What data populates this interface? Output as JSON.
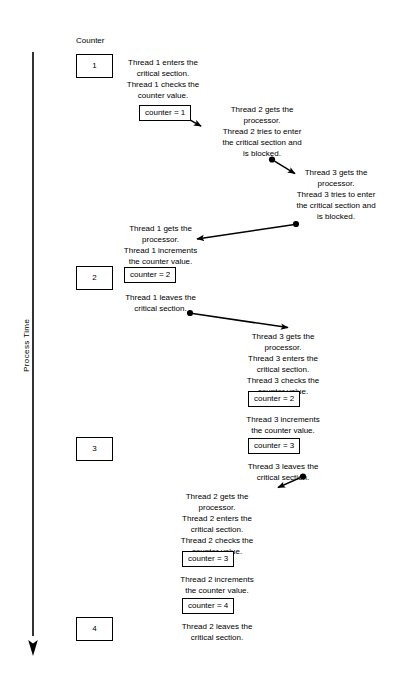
{
  "diagram": {
    "title_axis": "Process Time",
    "column_header": "Counter",
    "counter_values": [
      {
        "value": "1"
      },
      {
        "value": "2"
      },
      {
        "value": "3"
      },
      {
        "value": "4"
      }
    ],
    "value_boxes": [
      {
        "label": "counter = 1"
      },
      {
        "label": "counter = 2"
      },
      {
        "label": "counter = 2"
      },
      {
        "label": "counter = 3"
      },
      {
        "label": "counter = 3"
      },
      {
        "label": "counter = 4"
      }
    ],
    "events": [
      {
        "text": "Thread 1 enters the\ncritical section.\nThread 1 checks the\ncounter value."
      },
      {
        "text": "Thread 2 gets the\nprocessor.\nThread 2 tries to enter\nthe critical section and\nis blocked."
      },
      {
        "text": "Thread 3 gets the\nprocessor.\nThread 3 tries to enter\nthe critical section and\nis blocked."
      },
      {
        "text": "Thread 1 gets the\nprocessor.\nThread 1 increments\nthe counter value."
      },
      {
        "text": "Thread 1 leaves the\ncritical section."
      },
      {
        "text": "Thread 3 gets the\nprocessor.\nThread 3 enters the\ncritical section.\nThread 3 checks the\ncounter value."
      },
      {
        "text": "Thread 3 increments\nthe counter value."
      },
      {
        "text": "Thread 3 leaves the\ncritical section."
      },
      {
        "text": "Thread 2 gets the\nprocessor.\nThread 2 enters the\ncritical section.\nThread 2 checks the\ncounter value."
      },
      {
        "text": "Thread 2 increments\nthe counter value."
      },
      {
        "text": "Thread 2 leaves the\ncritical section."
      }
    ],
    "colors": {
      "ink": "#000000",
      "background": "#ffffff"
    }
  }
}
